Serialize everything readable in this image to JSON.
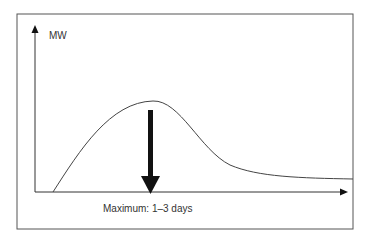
{
  "diagram": {
    "y_axis_label": "MW",
    "annotation": "Maximum: 1–3 days",
    "colors": {
      "frame": "#555555",
      "curve": "#444444",
      "arrow": "#111111",
      "text": "#333333"
    }
  }
}
